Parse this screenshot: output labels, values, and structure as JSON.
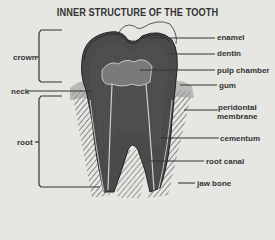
{
  "title": "INNER STRUCTURE OF THE TOOTH",
  "left_labels": {
    "crown": "crown",
    "neck": "neck",
    "root": "root"
  },
  "right_labels": {
    "enamel": "enamel",
    "dentin": "dentin",
    "pulp_chamber": "pulp chamber",
    "gum": "gum",
    "peridontal_line1": "peridontal",
    "peridontal_line2": "membrane",
    "cementum": "cementum",
    "root_canal": "root canal",
    "jaw_bone": "jaw bone"
  },
  "colors": {
    "background": "#e6e6e3",
    "ink": "#2a2a2a",
    "tooth_fill": "#4a4a4a"
  }
}
